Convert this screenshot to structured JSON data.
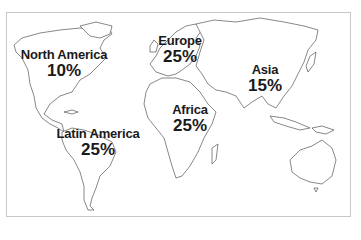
{
  "map": {
    "type": "world-outline",
    "regions": [
      {
        "name": "North America",
        "value": "10%"
      },
      {
        "name": "Europe",
        "value": "25%"
      },
      {
        "name": "Asia",
        "value": "15%"
      },
      {
        "name": "Africa",
        "value": "25%"
      },
      {
        "name": "Latin America",
        "value": "25%"
      }
    ]
  },
  "colors": {
    "outline": "#555555",
    "text": "#1a1a1a",
    "frame": "#c8c8c8",
    "background": "#ffffff"
  }
}
